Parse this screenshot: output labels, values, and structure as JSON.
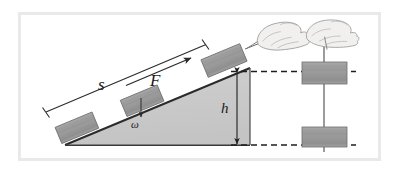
{
  "figure": {
    "kind": "physics-diagram",
    "frame": {
      "border_color": "#e7e7e7",
      "background": "#ffffff",
      "x": 19,
      "y": 13,
      "width": 361,
      "height": 147
    },
    "colors": {
      "incline_fill": "#c9c9c9",
      "block_fill": "#9b9b9b",
      "outline": "#2b2b2b",
      "dashed": "#1f1f1f",
      "hand_line": "#8a8a8a",
      "label_text": "#1a1a1a"
    },
    "labels": [
      {
        "id": "s",
        "text": "s",
        "meaning": "distance-along-incline",
        "x": 98,
        "y": 76
      },
      {
        "id": "F",
        "text": "F",
        "meaning": "applied-force",
        "x": 150,
        "y": 72
      },
      {
        "id": "omega",
        "text": "ω",
        "meaning": "weight",
        "x": 131,
        "y": 119
      },
      {
        "id": "h",
        "text": "h",
        "meaning": "height",
        "x": 221,
        "y": 101
      }
    ],
    "incline": {
      "apex": [
        250,
        68
      ],
      "base_left": [
        65,
        145
      ],
      "base_right": [
        250,
        145
      ],
      "slope_label": "ramp-hypotenuse"
    },
    "blocks": [
      {
        "id": "block-ramp-low",
        "on": "incline",
        "x": 57,
        "y": 119,
        "w": 40,
        "h": 18
      },
      {
        "id": "block-ramp-mid",
        "on": "incline",
        "x": 122,
        "y": 92,
        "w": 40,
        "h": 18
      },
      {
        "id": "block-ramp-top",
        "on": "incline",
        "x": 203,
        "y": 51,
        "w": 42,
        "h": 19
      },
      {
        "id": "block-lift-upper",
        "on": "string",
        "x": 302,
        "y": 63,
        "w": 44,
        "h": 22
      },
      {
        "id": "block-lift-lower",
        "on": "string",
        "x": 302,
        "y": 128,
        "w": 44,
        "h": 20
      }
    ],
    "hands": [
      {
        "id": "hand-pulling-ramp",
        "x": 252,
        "y": 33,
        "direction": "up-right-along-incline"
      },
      {
        "id": "hand-lifting-vertical",
        "x": 306,
        "y": 23,
        "direction": "vertical-up"
      }
    ],
    "dimension_lines": [
      {
        "id": "s-dimension",
        "from": [
          45,
          113
        ],
        "to": [
          205,
          45
        ],
        "label": "s",
        "ticks": "both-ends"
      },
      {
        "id": "h-dimension",
        "from": [
          237,
          72
        ],
        "to": [
          237,
          145
        ],
        "label": "h",
        "arrows": "both-ends"
      }
    ],
    "arrows": [
      {
        "id": "F-arrow",
        "from": [
          128,
          84
        ],
        "to": [
          190,
          58
        ],
        "label": "F"
      },
      {
        "id": "omega-arrow",
        "from": [
          142,
          100
        ],
        "to": [
          142,
          118
        ],
        "label": "ω"
      }
    ],
    "dashed_guides": [
      {
        "id": "dashed-top-level",
        "from": [
          237,
          72
        ],
        "to": [
          355,
          72
        ]
      },
      {
        "id": "dashed-bottom-level",
        "from": [
          237,
          145
        ],
        "to": [
          355,
          145
        ]
      }
    ]
  }
}
